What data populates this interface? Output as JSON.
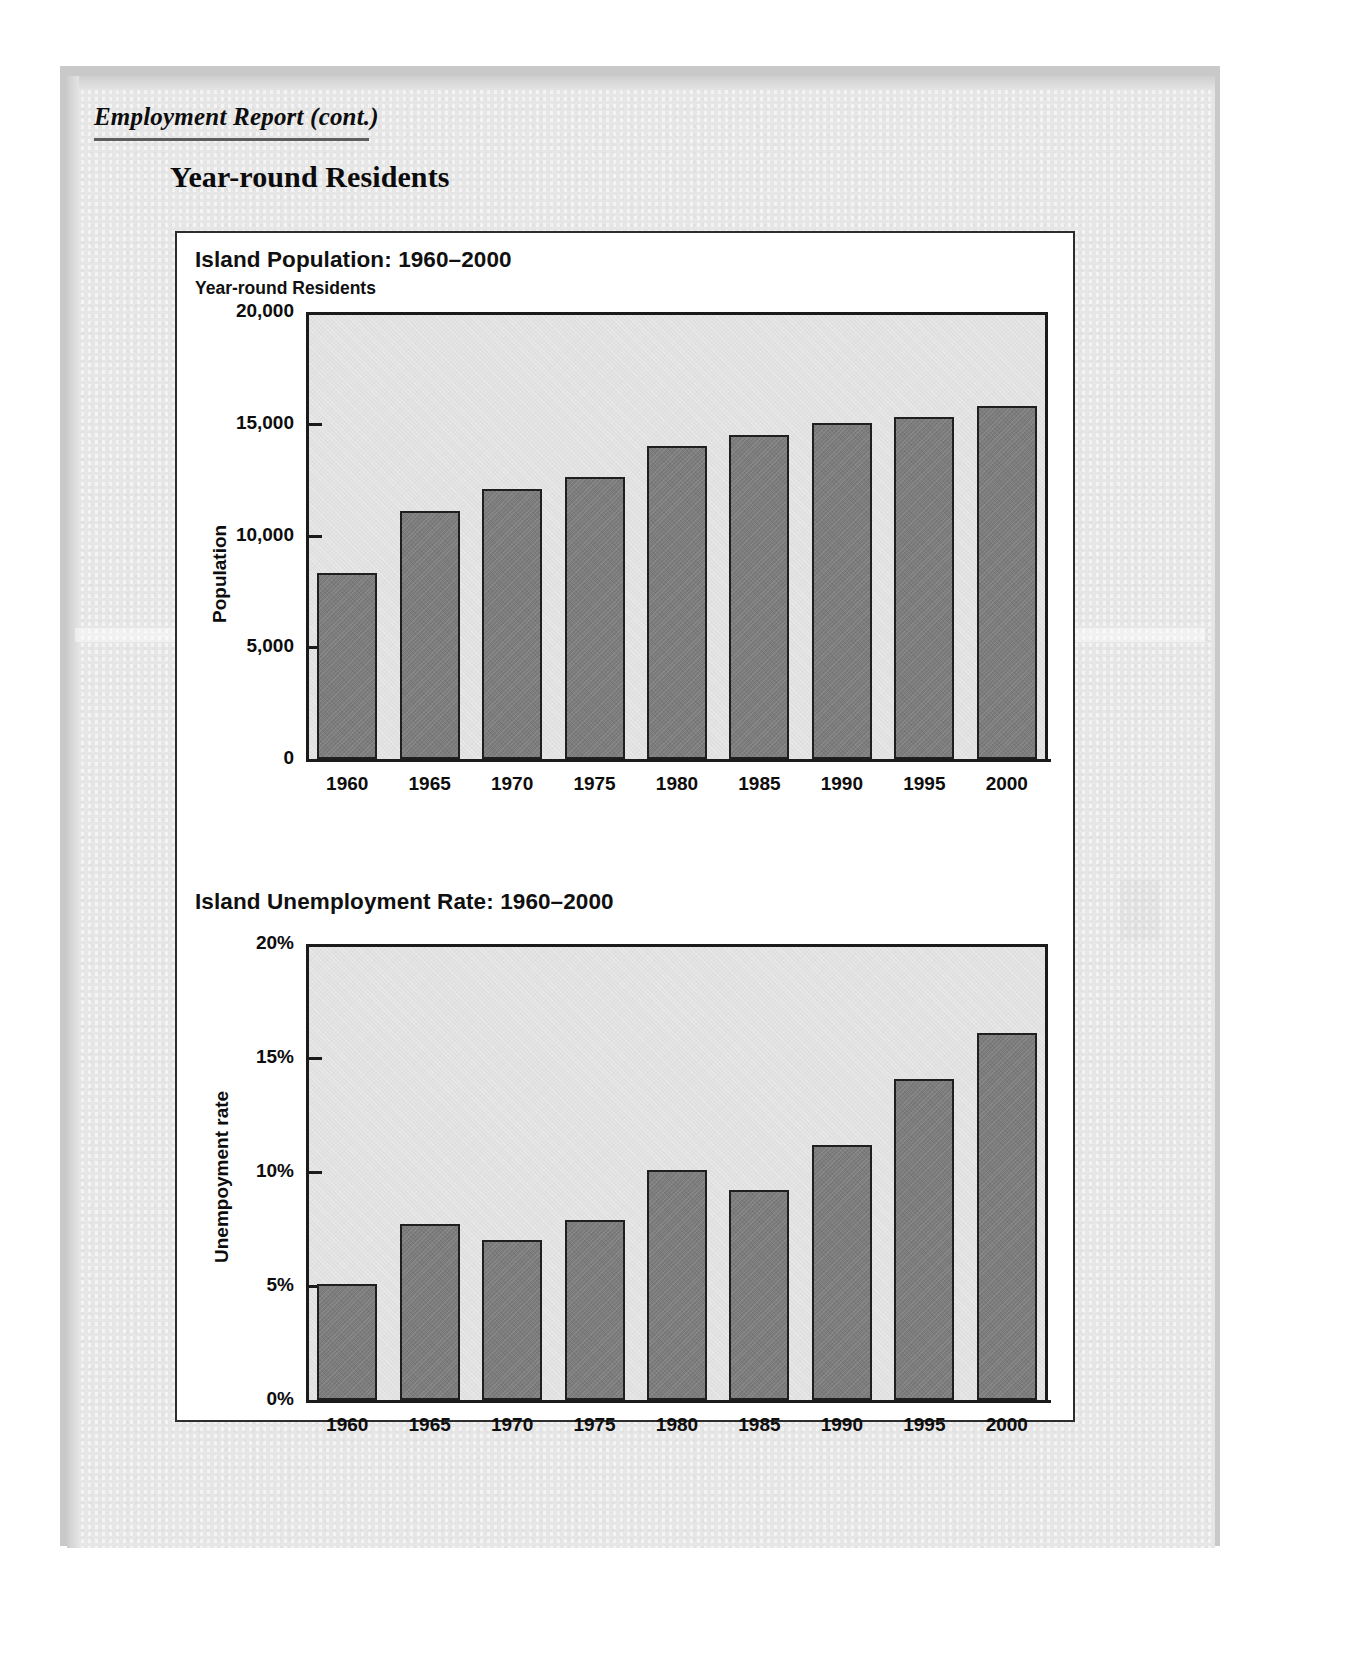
{
  "page": {
    "running_head": "Employment Report (cont.)",
    "section_heading": "Year-round Residents"
  },
  "chart_data": [
    {
      "type": "bar",
      "title": "Island Population: 1960–2000",
      "subtitle": "Year-round Residents",
      "xlabel": "",
      "ylabel": "Population",
      "ylim": [
        0,
        20000
      ],
      "yticks": [
        0,
        5000,
        10000,
        15000,
        20000
      ],
      "ytick_labels": [
        "0",
        "5,000",
        "10,000",
        "15,000",
        "20,000"
      ],
      "grid": false,
      "legend": false,
      "bar_color": "#7c7c7c",
      "plot_bg": "#e1e1e1",
      "categories": [
        "1960",
        "1965",
        "1970",
        "1975",
        "1980",
        "1985",
        "1990",
        "1995",
        "2000"
      ],
      "values": [
        8300,
        11100,
        12100,
        12600,
        14000,
        14500,
        15050,
        15300,
        15800
      ]
    },
    {
      "type": "bar",
      "title": "Island Unemployment Rate: 1960–2000",
      "subtitle": "",
      "xlabel": "",
      "ylabel": "Unempoyment rate",
      "ylim": [
        0,
        20
      ],
      "yticks": [
        0,
        5,
        10,
        15,
        20
      ],
      "ytick_labels": [
        "0%",
        "5%",
        "10%",
        "15%",
        "20%"
      ],
      "grid": false,
      "legend": false,
      "bar_color": "#7c7c7c",
      "plot_bg": "#e1e1e1",
      "categories": [
        "1960",
        "1965",
        "1970",
        "1975",
        "1980",
        "1985",
        "1990",
        "1995",
        "2000"
      ],
      "values": [
        5.1,
        7.7,
        7.0,
        7.9,
        10.1,
        9.2,
        11.2,
        14.1,
        16.1
      ]
    }
  ]
}
